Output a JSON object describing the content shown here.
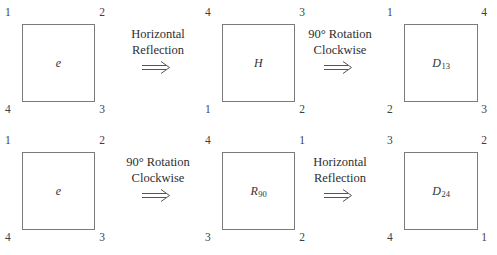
{
  "figure": {
    "line_color": "#7b7b7b",
    "text_color": "#3a3a3a"
  },
  "rows": [
    {
      "name": "row-horizontal-reflection-then-rotation",
      "cells": [
        {
          "label": "e",
          "subscript": "",
          "corners": {
            "tl": "1",
            "tr": "2",
            "br": "3",
            "bl": "4"
          }
        },
        {
          "label": "H",
          "subscript": "",
          "corners": {
            "tl": "4",
            "tr": "3",
            "br": "2",
            "bl": "1"
          }
        },
        {
          "label": "D",
          "subscript": "13",
          "corners": {
            "tl": "1",
            "tr": "4",
            "br": "3",
            "bl": "2"
          }
        }
      ],
      "operations": [
        {
          "line1": "Horizontal",
          "line2": "Reflection",
          "arrow": "double-right-arrow"
        },
        {
          "line1": "90° Rotation",
          "line2": "Clockwise",
          "arrow": "double-right-arrow"
        }
      ]
    },
    {
      "name": "row-rotation-then-horizontal-reflection",
      "cells": [
        {
          "label": "e",
          "subscript": "",
          "corners": {
            "tl": "1",
            "tr": "2",
            "br": "3",
            "bl": "4"
          }
        },
        {
          "label": "R",
          "subscript": "90",
          "corners": {
            "tl": "4",
            "tr": "1",
            "br": "2",
            "bl": "3"
          }
        },
        {
          "label": "D",
          "subscript": "24",
          "corners": {
            "tl": "3",
            "tr": "2",
            "br": "1",
            "bl": "4"
          }
        }
      ],
      "operations": [
        {
          "line1": "90° Rotation",
          "line2": "Clockwise",
          "arrow": "double-right-arrow"
        },
        {
          "line1": "Horizontal",
          "line2": "Reflection",
          "arrow": "double-right-arrow"
        }
      ]
    }
  ]
}
